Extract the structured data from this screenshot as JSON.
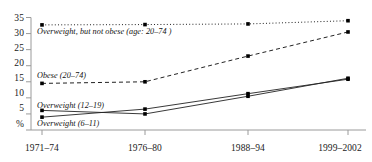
{
  "chart_data": {
    "type": "line",
    "title": "",
    "subtitle": "",
    "xlabel": "",
    "ylabel": "%",
    "categories": [
      "1971–74",
      "1976–80",
      "1988–94",
      "1999–2002"
    ],
    "ylim": [
      0,
      35
    ],
    "yticks": [
      0,
      5,
      10,
      15,
      20,
      25,
      30,
      35
    ],
    "ytick_labels": [
      "%",
      "5",
      "10",
      "15",
      "20",
      "25",
      "30",
      "35"
    ],
    "grid": false,
    "legend": "inline-annotations",
    "series": [
      {
        "name": "Overweight, but not obese (age: 20–74 )",
        "style": "dotted",
        "values": [
          32.7,
          32.8,
          33.0,
          34.0
        ]
      },
      {
        "name": "Obese (20–74)",
        "style": "dashed",
        "values": [
          14.5,
          15.0,
          23.0,
          30.5
        ]
      },
      {
        "name": "Overweight (12–19)",
        "style": "solid",
        "values": [
          6.1,
          5.0,
          10.5,
          16.1
        ]
      },
      {
        "name": "Overweight (6–11)",
        "style": "solid",
        "values": [
          4.0,
          6.5,
          11.3,
          15.8
        ]
      }
    ],
    "annotations": [
      "Overweight, but not obese (age: 20–74 )",
      "Obese (20–74)",
      "Overweight (12–19)",
      "Overweight (6–11)"
    ],
    "colors": {
      "line": "#222222",
      "marker": "#000000",
      "axis": "#9a9a9a",
      "text": "#1a1a1a"
    }
  },
  "axis": {
    "y_ticks": [
      {
        "label": "35",
        "value": 35
      },
      {
        "label": "30",
        "value": 30
      },
      {
        "label": "25",
        "value": 25
      },
      {
        "label": "20",
        "value": 20
      },
      {
        "label": "15",
        "value": 15
      },
      {
        "label": "10",
        "value": 10
      },
      {
        "label": "5",
        "value": 5
      },
      {
        "label": "%",
        "value": 0
      }
    ],
    "x_ticks": [
      {
        "label": "1971–74"
      },
      {
        "label": "1976–80"
      },
      {
        "label": "1988–94"
      },
      {
        "label": "1999–2002"
      }
    ]
  },
  "labels": {
    "overweight_not_obese": "Overweight, but not obese (age: 20–74 )",
    "obese": "Obese (20–74)",
    "overweight_12_19": "Overweight (12–19)",
    "overweight_6_11": "Overweight (6–11)"
  }
}
